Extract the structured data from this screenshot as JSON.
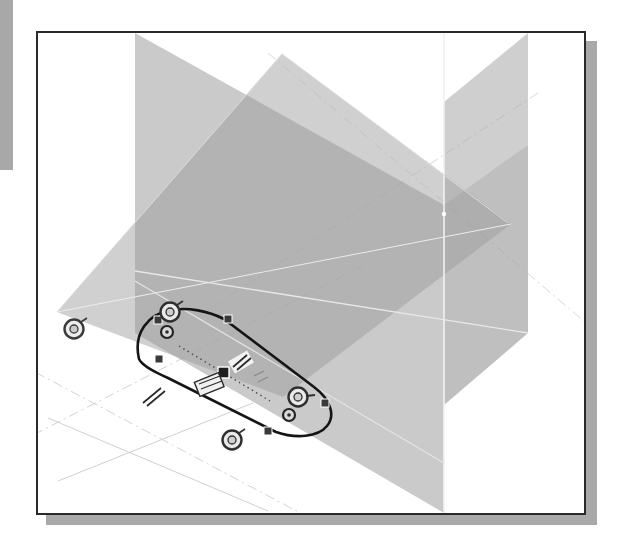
{
  "app": {
    "type": "cad-3d-sketch-viewport",
    "title": "3D Sketch Viewport"
  },
  "viewport": {
    "background_color": "#ffffff",
    "border_color": "#2a2a2a",
    "shadow_color": "#a9a9a9",
    "page_edge_color": "#a8a8a8"
  },
  "scene": {
    "origin_label": "origin",
    "planes": [
      {
        "name": "ground-plane",
        "orientation": "horizontal",
        "fill": "#b9b9b9",
        "opacity": 0.55,
        "points": "19,279 244,21 473,191 245,364"
      },
      {
        "name": "vertical-plane-left",
        "orientation": "vertical-depth",
        "fill": "#9e9e9e",
        "opacity": 0.5,
        "points": "97,0 97,300 406,480 406,178"
      },
      {
        "name": "vertical-plane-right",
        "orientation": "vertical-front",
        "fill": "#a6a6a6",
        "opacity": 0.5,
        "points": "406,69 490,0 490,300 406,370"
      }
    ],
    "axes": [
      {
        "name": "axis-x",
        "style": "dash-dot",
        "color": "#c4c4c4"
      },
      {
        "name": "axis-y",
        "style": "dash-dot",
        "color": "#c4c4c4"
      },
      {
        "name": "axis-z",
        "style": "solid-light",
        "color": "#e2e2e2"
      }
    ]
  },
  "sketch": {
    "name": "slot-profile-sketch",
    "line_color": "#111111",
    "construction_color": "#555555",
    "entities": [
      {
        "name": "slot-outline",
        "type": "closed-profile",
        "shape": "stadium"
      },
      {
        "name": "construction-line",
        "type": "dotted-centerline"
      },
      {
        "name": "sketch-point-top-left",
        "type": "square-point",
        "x": 157,
        "y": 289
      },
      {
        "name": "sketch-point-left",
        "type": "square-point",
        "x": 101,
        "y": 326
      },
      {
        "name": "sketch-point-right",
        "type": "square-point",
        "x": 284,
        "y": 371
      },
      {
        "name": "sketch-point-bottom",
        "type": "square-point",
        "x": 228,
        "y": 409
      },
      {
        "name": "sketch-point-small-upper",
        "type": "small-square",
        "x": 130,
        "y": 312
      },
      {
        "name": "sketch-point-small-lower",
        "type": "small-square",
        "x": 252,
        "y": 394
      }
    ],
    "handles": [
      {
        "name": "circle-handle-top",
        "type": "circle-grip",
        "x": 133,
        "y": 292,
        "r": 9
      },
      {
        "name": "circle-handle-right",
        "type": "circle-grip",
        "x": 261,
        "y": 377,
        "r": 9
      },
      {
        "name": "circle-handle-bottom",
        "type": "circle-grip",
        "x": 195,
        "y": 419,
        "r": 9
      },
      {
        "name": "circle-handle-outside",
        "type": "circle-grip",
        "x": 72,
        "y": 327,
        "r": 9
      }
    ],
    "constraints": [
      {
        "name": "constraint-parallel-upper",
        "symbol": "parallel-marks",
        "x": 205,
        "y": 344
      },
      {
        "name": "constraint-coincident",
        "symbol": "square-node",
        "x": 187,
        "y": 352
      },
      {
        "name": "constraint-dimension-block",
        "symbol": "dimension-tag",
        "x": 176,
        "y": 363
      },
      {
        "name": "constraint-parallel-lower",
        "symbol": "parallel-marks",
        "x": 152,
        "y": 381
      }
    ]
  }
}
